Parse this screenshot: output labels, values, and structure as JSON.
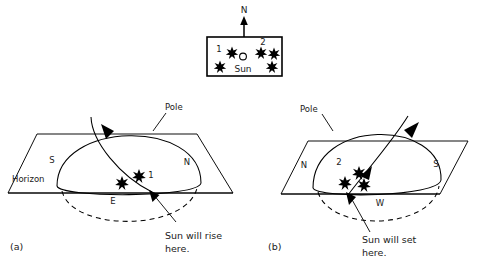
{
  "figure": {
    "title_present": false,
    "colors": {
      "ink": "#000000",
      "paper": "#ffffff",
      "text": "#1a1a1a"
    }
  },
  "inset": {
    "name": "sky-inset-box",
    "north_arrow_label": "N",
    "sun_label": "Sun",
    "sun_marker": "open-circle",
    "star_label_1": "1",
    "star_label_2": "2",
    "stars": [
      {
        "id": "s1",
        "cx": 232,
        "cy": 52,
        "r": 5.0,
        "label": "1"
      },
      {
        "id": "s2",
        "cx": 220,
        "cy": 66,
        "r": 5.0,
        "label": ""
      },
      {
        "id": "s3",
        "cx": 261,
        "cy": 52,
        "r": 5.0,
        "label": "2"
      },
      {
        "id": "s4",
        "cx": 274,
        "cy": 53,
        "r": 5.0,
        "label": ""
      },
      {
        "id": "s5",
        "cx": 272,
        "cy": 66,
        "r": 5.0,
        "label": ""
      }
    ]
  },
  "panel_a": {
    "caption": "(a)",
    "pole_label": "Pole",
    "horizon_label": "Horizon",
    "compass": {
      "left": "S",
      "right": "N",
      "front": "E"
    },
    "annotation": {
      "line1": "Sun will rise",
      "line2": "here."
    },
    "star_label": "1",
    "stars": [
      {
        "id": "a1",
        "cx": 122,
        "cy": 182,
        "r": 5.4,
        "label": ""
      },
      {
        "id": "a2",
        "cx": 139,
        "cy": 175,
        "r": 5.4,
        "label": "1"
      }
    ]
  },
  "panel_b": {
    "caption": "(b)",
    "pole_label": "Pole",
    "horizon_label": "",
    "compass": {
      "left": "N",
      "right": "S",
      "front": "W"
    },
    "annotation": {
      "line1": "Sun will set",
      "line2": "here."
    },
    "star_label": "2",
    "stars": [
      {
        "id": "b1",
        "cx": 359,
        "cy": 172,
        "r": 5.4,
        "label": ""
      },
      {
        "id": "b2",
        "cx": 345,
        "cy": 182,
        "r": 5.4,
        "label": ""
      },
      {
        "id": "b3",
        "cx": 364,
        "cy": 184,
        "r": 5.4,
        "label": ""
      }
    ]
  }
}
